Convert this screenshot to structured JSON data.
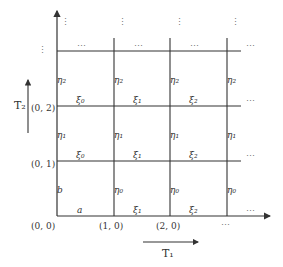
{
  "diagram": {
    "type": "lattice",
    "colors": {
      "line": "#333333",
      "text": "#333333",
      "dots": "#777777"
    },
    "axis_labels": {
      "T1": "T₁",
      "T2": "T₂"
    },
    "coordinates": {
      "origin": "(0, 0)",
      "x1": "(1, 0)",
      "x2": "(2, 0)",
      "x_more": "⋯",
      "y1": "(0, 1)",
      "y2": "(0, 2)",
      "y_more": "⋮"
    },
    "horizontal_edges": {
      "row0": [
        "a",
        "ξ₁",
        "ξ₂",
        "⋯"
      ],
      "row1": [
        "ξ₀",
        "ξ₁",
        "ξ₂",
        "⋯"
      ],
      "row2": [
        "ξ₀",
        "ξ₁",
        "ξ₂",
        "⋯"
      ],
      "row3": [
        "⋯",
        "⋯",
        "⋯",
        "⋯"
      ]
    },
    "vertical_edges": {
      "col0": [
        "b",
        "η₁",
        "η₂"
      ],
      "col1": [
        "η₀",
        "η₁",
        "η₂"
      ],
      "col2": [
        "η₀",
        "η₁",
        "η₂"
      ],
      "col3": [
        "η₀",
        "η₁",
        "η₂"
      ]
    },
    "top_continuations": [
      "⋮",
      "⋮",
      "⋮",
      "⋮"
    ]
  }
}
